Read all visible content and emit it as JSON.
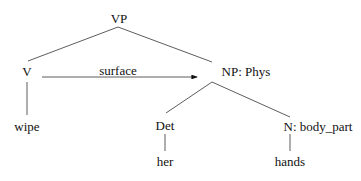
{
  "diagram": {
    "type": "syntax-tree",
    "nodes": {
      "vp": {
        "label": "VP",
        "x": 119,
        "y": 18
      },
      "v": {
        "label": "V",
        "x": 27,
        "y": 71
      },
      "np": {
        "label": "NP: Phys",
        "x": 246,
        "y": 71
      },
      "wipe": {
        "label": "wipe",
        "x": 27,
        "y": 126
      },
      "det": {
        "label": "Det",
        "x": 165,
        "y": 125
      },
      "n": {
        "label": "N: body_part",
        "x": 318,
        "y": 126
      },
      "her": {
        "label": "her",
        "x": 165,
        "y": 161
      },
      "hands": {
        "label": "hands",
        "x": 290,
        "y": 161
      }
    },
    "edges": [
      {
        "from": "vp",
        "to": "v",
        "x1": 118,
        "y1": 27,
        "x2": 28,
        "y2": 61
      },
      {
        "from": "vp",
        "to": "np",
        "x1": 118,
        "y1": 27,
        "x2": 212,
        "y2": 62
      },
      {
        "from": "v",
        "to": "wipe",
        "x1": 27,
        "y1": 82,
        "x2": 27,
        "y2": 115
      },
      {
        "from": "np",
        "to": "det",
        "x1": 212,
        "y1": 82,
        "x2": 166,
        "y2": 113
      },
      {
        "from": "np",
        "to": "n",
        "x1": 212,
        "y1": 82,
        "x2": 290,
        "y2": 117
      },
      {
        "from": "det",
        "to": "her",
        "x1": 165,
        "y1": 134,
        "x2": 165,
        "y2": 151
      },
      {
        "from": "n",
        "to": "hands",
        "x1": 290,
        "y1": 134,
        "x2": 290,
        "y2": 151
      }
    ],
    "arrow": {
      "label": "surface",
      "label_x": 118,
      "label_y": 70,
      "x1": 42,
      "y1": 77,
      "x2": 197,
      "y2": 77
    },
    "line_color": "#333333"
  }
}
